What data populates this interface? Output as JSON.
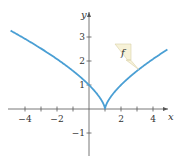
{
  "chart_data": {
    "type": "line",
    "title": "",
    "xlabel": "x",
    "ylabel": "y",
    "function_label": "f",
    "function_formula": "f(x) = |x - 1|^(2/3)",
    "xlim": [
      -5,
      5
    ],
    "ylim": [
      -1.8,
      4
    ],
    "x_ticks": [
      -4,
      -3,
      -2,
      -1,
      1,
      2,
      3,
      4
    ],
    "x_tick_labels": [
      {
        "value": -4,
        "label": "−4"
      },
      {
        "value": -2,
        "label": "−2"
      },
      {
        "value": 2,
        "label": "2"
      },
      {
        "value": 4,
        "label": "4"
      }
    ],
    "y_ticks": [
      -1,
      1,
      2,
      3
    ],
    "y_tick_labels": [
      {
        "value": -1,
        "label": "−1"
      },
      {
        "value": 1,
        "label": "1"
      },
      {
        "value": 2,
        "label": "2"
      },
      {
        "value": 3,
        "label": "3"
      }
    ],
    "grid": false,
    "legend": "none",
    "series": [
      {
        "name": "f",
        "color": "#4a9fd4",
        "x": [
          -4.9,
          -4,
          -3,
          -2,
          -1,
          0,
          0.5,
          0.9,
          1,
          1.1,
          1.5,
          2,
          3,
          4,
          4.9
        ],
        "y": [
          3.25,
          2.92,
          2.52,
          2.08,
          1.59,
          1.0,
          0.63,
          0.22,
          0.0,
          0.22,
          0.63,
          1.0,
          1.59,
          2.08,
          2.48
        ]
      }
    ],
    "annotations": [
      {
        "text": "f",
        "type": "callout",
        "points_to": {
          "x": 3.1,
          "y": 1.65
        }
      }
    ]
  },
  "colors": {
    "curve": "#4a9fd4",
    "axis": "#555555",
    "callout_fill": "#f7f2d8",
    "callout_stroke": "#d8d0a8"
  }
}
